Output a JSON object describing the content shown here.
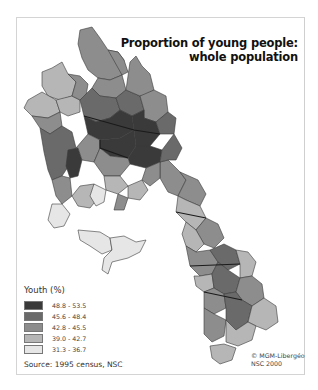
{
  "map": {
    "title_line1": "Proportion of young people:",
    "title_line2": "whole population",
    "legend": {
      "title": "Youth (%)",
      "classes": [
        {
          "label": "48.8 - 53.5",
          "color": "#3a3a3a"
        },
        {
          "label": "45.6 - 48.4",
          "color": "#6a6a6a"
        },
        {
          "label": "42.8 - 45.5",
          "color": "#8d8d8d"
        },
        {
          "label": "39.0 - 42.7",
          "color": "#b6b6b6"
        },
        {
          "label": "31.3 - 36.7",
          "color": "#e6e6e6"
        }
      ]
    },
    "source": "Source: 1995 census, NSC",
    "copyright_line1": "© MGM-Libergéo",
    "copyright_line2": "NSC 2000"
  }
}
